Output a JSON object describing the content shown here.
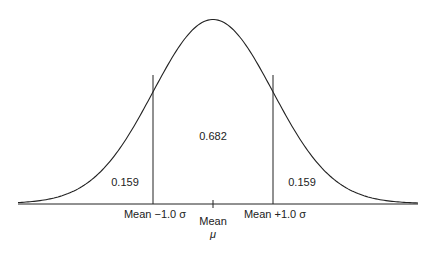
{
  "chart_data": {
    "type": "area",
    "title": "",
    "distribution": "normal",
    "x_labels": [
      {
        "label": "Mean −1.0 σ",
        "position": -1.0
      },
      {
        "label": "Mean",
        "sub": "μ",
        "position": 0
      },
      {
        "label": "Mean +1.0 σ",
        "position": 1.0
      }
    ],
    "regions": [
      {
        "name": "left-tail",
        "range": [
          "-inf",
          -1.0
        ],
        "area_label": "0.159"
      },
      {
        "name": "center",
        "range": [
          -1.0,
          1.0
        ],
        "area_label": "0.682"
      },
      {
        "name": "right-tail",
        "range": [
          1.0,
          "inf"
        ],
        "area_label": "0.159"
      }
    ],
    "grid": false,
    "legend": "none"
  },
  "labels": {
    "left_area": "0.159",
    "center_area": "0.682",
    "right_area": "0.159",
    "minus_sigma": "Mean −1.0 σ",
    "mean": "Mean",
    "mu": "μ",
    "plus_sigma": "Mean +1.0 σ"
  }
}
